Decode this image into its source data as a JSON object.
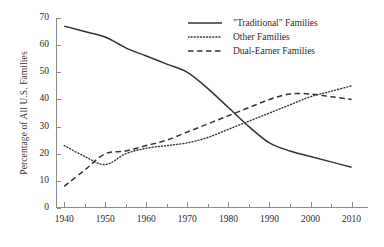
{
  "chart_data": {
    "type": "line",
    "title": "",
    "xlabel": "",
    "ylabel": "Percentage of All U.S. Families",
    "xlim": [
      1938,
      2014
    ],
    "ylim": [
      0,
      70
    ],
    "grid": false,
    "legend_position": "top-right",
    "x_ticks_major": [
      1940,
      1950,
      1960,
      1970,
      1980,
      1990,
      2000,
      2010
    ],
    "x_ticks_minor": [
      1945,
      1955,
      1965,
      1975,
      1985,
      1995,
      2005
    ],
    "y_ticks": [
      0,
      10,
      20,
      30,
      40,
      50,
      60,
      70
    ],
    "x_tick_labels": [
      "1940",
      "1950",
      "1960",
      "1970",
      "1980",
      "1990",
      "2000",
      "2010"
    ],
    "y_tick_labels": [
      "0",
      "10",
      "20",
      "30",
      "40",
      "50",
      "60",
      "70"
    ],
    "x": [
      1940,
      1945,
      1950,
      1955,
      1960,
      1965,
      1970,
      1975,
      1980,
      1985,
      1990,
      1995,
      2000,
      2005,
      2010
    ],
    "series": [
      {
        "name": "\"Traditional\" Families",
        "style": "solid",
        "color": "#333333",
        "values": [
          67,
          65,
          63,
          59,
          56,
          53,
          50,
          44,
          37,
          30,
          24,
          21,
          19,
          17,
          15
        ]
      },
      {
        "name": "Other Families",
        "style": "dotted",
        "color": "#333333",
        "values": [
          23,
          19,
          16,
          20,
          22,
          23,
          24,
          26,
          29,
          32,
          35,
          38,
          41,
          43,
          45
        ]
      },
      {
        "name": "Dual-Earner Families",
        "style": "dashed",
        "color": "#333333",
        "values": [
          8,
          14,
          20,
          21,
          23,
          25,
          28,
          31,
          34,
          37,
          40,
          42,
          42,
          41,
          40
        ]
      }
    ]
  },
  "legend": {
    "items": [
      {
        "label": "\"Traditional\" Families",
        "style": "solid"
      },
      {
        "label": "Other Families",
        "style": "dotted"
      },
      {
        "label": "Dual-Earner Families",
        "style": "dashed"
      }
    ]
  },
  "axes": {
    "y_title": "Percentage of All U.S. Families"
  }
}
